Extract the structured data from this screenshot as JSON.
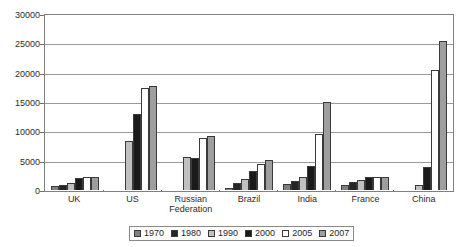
{
  "chart_data": {
    "type": "bar",
    "title": "",
    "subtitle": "",
    "xlabel": "",
    "ylabel": "",
    "ylim": [
      0,
      30000
    ],
    "ytick_labels": [
      "0",
      "5000",
      "10000",
      "15000",
      "20000",
      "25000",
      "30000"
    ],
    "ytick_values": [
      0,
      5000,
      10000,
      15000,
      20000,
      25000,
      30000
    ],
    "grid": true,
    "legend_position": "bottom",
    "categories": [
      "UK",
      "US",
      "Russian Federation",
      "Brazil",
      "India",
      "France",
      "China"
    ],
    "series": [
      {
        "name": "1970",
        "color": "#808080",
        "values": [
          600,
          0,
          0,
          400,
          1100,
          900,
          0
        ]
      },
      {
        "name": "1980",
        "color": "#262626",
        "values": [
          900,
          0,
          0,
          1200,
          1500,
          1300,
          0
        ]
      },
      {
        "name": "1990",
        "color": "#c0c0c0",
        "values": [
          1250,
          8400,
          5700,
          1900,
          2300,
          1700,
          900
        ]
      },
      {
        "name": "2000",
        "color": "#1a1a1a",
        "values": [
          2000,
          13000,
          5400,
          3200,
          4100,
          2300,
          3900
        ]
      },
      {
        "name": "2005",
        "color": "#ffffff",
        "values": [
          2250,
          17400,
          8900,
          4400,
          9500,
          2200,
          20500
        ]
      },
      {
        "name": "2007",
        "color": "#9e9e9e",
        "values": [
          2300,
          17700,
          9200,
          5100,
          15000,
          2300,
          25400
        ]
      }
    ]
  },
  "legend": {
    "items": [
      {
        "label": "1970",
        "color": "#808080"
      },
      {
        "label": "1980",
        "color": "#262626"
      },
      {
        "label": "1990",
        "color": "#c0c0c0"
      },
      {
        "label": "2000",
        "color": "#1a1a1a"
      },
      {
        "label": "2005",
        "color": "#ffffff"
      },
      {
        "label": "2007",
        "color": "#9e9e9e"
      }
    ]
  }
}
